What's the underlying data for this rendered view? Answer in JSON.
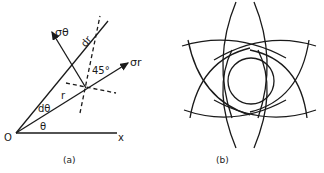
{
  "figure_a": {
    "caption": "(a)",
    "labels": {
      "sigma_theta": "σθ",
      "dr": "dr",
      "angle_45": "45°",
      "sigma_r": "σr",
      "r": "r",
      "d_theta": "dθ",
      "theta": "θ",
      "origin": "O",
      "x_axis": "x"
    }
  },
  "figure_b": {
    "caption": "(b)"
  },
  "colors": {
    "ink": "#1a1a1a",
    "background": "#ffffff"
  }
}
